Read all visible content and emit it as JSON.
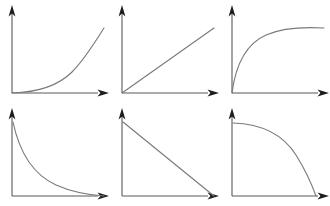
{
  "figure": {
    "background_color": "#ffffff",
    "axis_color": "#595959",
    "arrow_color": "#1c1c1c",
    "curve_color": "#7a7a7a",
    "rows": 2,
    "columns": 3,
    "panel_width": 110,
    "panel_height": 103
  },
  "chart_data": [
    {
      "type": "line",
      "title": "",
      "xlabel": "",
      "ylabel": "",
      "panel_index": 1,
      "shape": "convex-increasing",
      "description": "exponential growth curve rising from origin",
      "grid": false,
      "legend": "none",
      "xlim": [
        0,
        1
      ],
      "ylim": [
        0,
        1
      ],
      "x": [
        0,
        0.1,
        0.2,
        0.3,
        0.4,
        0.5,
        0.6,
        0.7,
        0.8,
        0.9,
        1
      ],
      "y": [
        0,
        0.02,
        0.05,
        0.09,
        0.14,
        0.21,
        0.3,
        0.42,
        0.57,
        0.76,
        1
      ]
    },
    {
      "type": "line",
      "title": "",
      "xlabel": "",
      "ylabel": "",
      "panel_index": 2,
      "shape": "linear-increasing",
      "description": "straight line rising from origin",
      "grid": false,
      "legend": "none",
      "xlim": [
        0,
        1
      ],
      "ylim": [
        0,
        1
      ],
      "x": [
        0,
        0.25,
        0.5,
        0.75,
        1
      ],
      "y": [
        0,
        0.25,
        0.5,
        0.75,
        1
      ]
    },
    {
      "type": "line",
      "title": "",
      "xlabel": "",
      "ylabel": "",
      "panel_index": 3,
      "shape": "concave-increasing",
      "description": "saturating logarithmic curve rising from origin and flattening",
      "grid": false,
      "legend": "none",
      "xlim": [
        0,
        1
      ],
      "ylim": [
        0,
        1
      ],
      "x": [
        0,
        0.1,
        0.2,
        0.3,
        0.4,
        0.5,
        0.6,
        0.7,
        0.8,
        0.9,
        1
      ],
      "y": [
        0,
        0.36,
        0.58,
        0.72,
        0.81,
        0.88,
        0.92,
        0.95,
        0.97,
        0.99,
        1
      ]
    },
    {
      "type": "line",
      "title": "",
      "xlabel": "",
      "ylabel": "",
      "panel_index": 4,
      "shape": "convex-decreasing",
      "description": "exponential decay curve falling from top-left toward the x-axis",
      "grid": false,
      "legend": "none",
      "xlim": [
        0,
        1
      ],
      "ylim": [
        0,
        1
      ],
      "x": [
        0,
        0.1,
        0.2,
        0.3,
        0.4,
        0.5,
        0.6,
        0.7,
        0.8,
        0.9,
        1
      ],
      "y": [
        1,
        0.66,
        0.44,
        0.3,
        0.2,
        0.14,
        0.1,
        0.07,
        0.04,
        0.02,
        0
      ]
    },
    {
      "type": "line",
      "title": "",
      "xlabel": "",
      "ylabel": "",
      "panel_index": 5,
      "shape": "linear-decreasing",
      "description": "straight line falling from top-left to the x-axis at right",
      "grid": false,
      "legend": "none",
      "xlim": [
        0,
        1
      ],
      "ylim": [
        0,
        1
      ],
      "x": [
        0,
        0.25,
        0.5,
        0.75,
        1
      ],
      "y": [
        1,
        0.75,
        0.5,
        0.25,
        0
      ]
    },
    {
      "type": "line",
      "title": "",
      "xlabel": "",
      "ylabel": "",
      "panel_index": 6,
      "shape": "concave-decreasing",
      "description": "quarter-circle falloff, flat at top-left then dropping steeply to the x-axis",
      "grid": false,
      "legend": "none",
      "xlim": [
        0,
        1
      ],
      "ylim": [
        0,
        1
      ],
      "x": [
        0,
        0.1,
        0.2,
        0.3,
        0.4,
        0.5,
        0.6,
        0.7,
        0.8,
        0.9,
        1
      ],
      "y": [
        1,
        0.995,
        0.98,
        0.954,
        0.917,
        0.866,
        0.8,
        0.714,
        0.6,
        0.436,
        0
      ]
    }
  ],
  "panels": [
    {
      "name": "panel-convex-increasing",
      "curve_path": "M 12,93 C 38,92.2 58,86 72,72 C 84,60 94,44 104,28"
    },
    {
      "name": "panel-linear-increasing",
      "curve_path": "M 12,93 L 104,28"
    },
    {
      "name": "panel-concave-increasing",
      "curve_path": "M 12,93 C 16,62 28,43 46,35 C 64,27 86,27 104,28"
    },
    {
      "name": "panel-convex-decreasing",
      "curve_path": "M 13,19 C 20,52 34,72 56,82 C 74,90 90,92 104,93"
    },
    {
      "name": "panel-linear-decreasing",
      "curve_path": "M 13,19 L 104,93"
    },
    {
      "name": "panel-concave-decreasing",
      "curve_path": "M 13,20 C 44,21 64,33 76,52 C 86,68 92,82 96,93"
    }
  ],
  "axes": {
    "y_axis_path": "M 12,93 L 12,12",
    "x_axis_path": "M 12,93 L 98,93",
    "y_arrow_points": "12,5 8.6,16.5 12,13.6 15.4,16.5",
    "x_arrow_points": "109,93 97.5,89.6 100.4,93 97.5,96.4"
  }
}
